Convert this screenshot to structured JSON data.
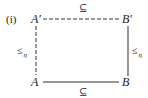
{
  "diagram": {
    "label": "(i)",
    "nodes": {
      "top_left": "A′",
      "top_right": "B′",
      "bottom_left": "A",
      "bottom_right": "B"
    },
    "edges": {
      "top": {
        "label": "⊆",
        "style": "dashed"
      },
      "bottom": {
        "label": "⊆",
        "style": "solid"
      },
      "left": {
        "label": "≤",
        "subscript": "η",
        "style": "dashed"
      },
      "right": {
        "label": "≤",
        "subscript": "η",
        "style": "solid"
      }
    },
    "colors": {
      "ink": "#1a1a1a",
      "background": "#ffffff"
    }
  }
}
